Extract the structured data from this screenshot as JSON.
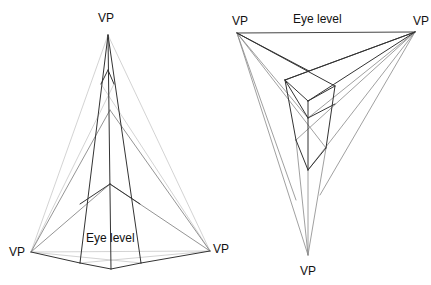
{
  "left_diagram": {
    "title": "Three-point perspective (worm's eye view)",
    "labels": {
      "vp_top": "VP",
      "vp_left": "VP",
      "vp_right": "VP",
      "eye_level": "Eye level"
    },
    "points": {
      "vp_top": [
        108,
        35
      ],
      "vp_left": [
        31,
        252
      ],
      "vp_right": [
        210,
        251
      ],
      "base_front": [
        111,
        269
      ],
      "base_left": [
        80,
        263
      ],
      "base_right": [
        141,
        263
      ],
      "mid_front": [
        110,
        184
      ],
      "top_front": [
        108,
        70
      ],
      "top_left": [
        101,
        84
      ],
      "top_right": [
        114,
        84
      ]
    },
    "colors": {
      "dark": "#333333",
      "light": "#bbbbbb"
    }
  },
  "right_diagram": {
    "title": "Three-point perspective (bird's eye view)",
    "labels": {
      "vp_left": "VP",
      "vp_right": "VP",
      "vp_bottom": "VP",
      "eye_level": "Eye level"
    },
    "points": {
      "vp_left": [
        237,
        33
      ],
      "vp_right": [
        415,
        32
      ],
      "vp_bottom": [
        308,
        255
      ],
      "box_top_back": [
        309,
        71
      ],
      "box_top_left": [
        285,
        80
      ],
      "box_top_right": [
        335,
        86
      ],
      "box_top_front": [
        308,
        101
      ],
      "box_mid_front": [
        308,
        118
      ],
      "box_bottom_front": [
        307,
        170
      ],
      "box_left_low": [
        296,
        140
      ],
      "box_right_low": [
        326,
        148
      ]
    },
    "colors": {
      "dark": "#333333",
      "light": "#999999"
    }
  }
}
